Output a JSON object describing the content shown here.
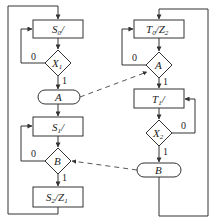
{
  "diagram": {
    "type": "ASM chart (two interacting state machines)",
    "left_machine": {
      "states": [
        {
          "name": "S0",
          "label_main": "S",
          "label_sub": "0",
          "label_suffix": "/"
        },
        {
          "name": "S1",
          "label_main": "S",
          "label_sub": "1",
          "label_suffix": "/"
        },
        {
          "name": "S2",
          "label_main": "S",
          "label_sub": "2",
          "label_suffix": "/Z",
          "label_sub2": "1"
        }
      ],
      "decisions": [
        {
          "name": "X1",
          "label_main": "X",
          "label_sub": "1",
          "zero": "0",
          "one": "1"
        },
        {
          "name": "B",
          "label_main": "B",
          "zero": "0",
          "one": "1"
        }
      ],
      "conditional_outputs": [
        {
          "name": "A",
          "label": "A"
        }
      ]
    },
    "right_machine": {
      "states": [
        {
          "name": "T0",
          "label_main": "T",
          "label_sub": "0",
          "label_suffix": "/Z",
          "label_sub2": "2"
        },
        {
          "name": "T1",
          "label_main": "T",
          "label_sub": "1",
          "label_suffix": "/"
        }
      ],
      "decisions": [
        {
          "name": "A",
          "label_main": "A",
          "zero": "0",
          "one": "1"
        },
        {
          "name": "X2",
          "label_main": "X",
          "label_sub": "2",
          "zero": "0",
          "one": "1"
        }
      ],
      "conditional_outputs": [
        {
          "name": "B",
          "label": "B"
        }
      ]
    },
    "signal_links": [
      {
        "from": "left.A-output",
        "to": "right.A-decision",
        "style": "dashed"
      },
      {
        "from": "right.B-output",
        "to": "left.B-decision",
        "style": "dashed"
      }
    ]
  }
}
